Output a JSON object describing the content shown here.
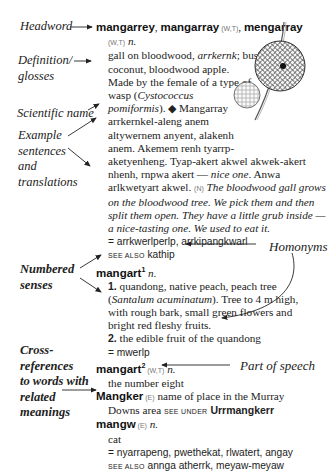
{
  "annotations": {
    "headword": "Headword",
    "definition": [
      "Definition/",
      "glosses"
    ],
    "scientific": "Scientific name",
    "examples": [
      "Example",
      "sentences",
      "and",
      "translations"
    ],
    "homonyms": "Homonyms",
    "numbered": [
      "Numbered",
      "senses"
    ],
    "crossref": [
      "Cross-",
      "references",
      "to words with",
      "related",
      "meanings"
    ],
    "pos": "Part of speech"
  },
  "entries": {
    "mangarrey": {
      "hw1": "mangarrey",
      "sep1": ", ",
      "hw2": "mangarray",
      "dial2": " (W,T)",
      "sep2": ", ",
      "hw3": "mengarray",
      "dial3": "(W,T)",
      "pos": " n.",
      "def_lines": [
        "gall on bloodwood, ",
        "coconut, bloodwood apple.",
        "Made by the female of a type of",
        "wasp (",
        "pomiformis"
      ],
      "def_italic": "arrkernk",
      "def_tail": "; bush",
      "sci_name_1": "Cystococcus",
      "sci_tail": "). ◆ Mangarray",
      "example_lines": [
        "arrkernkel-aleng anem",
        "altywernem anyent, alakenh",
        "anem. Akemem renh tyarrp-",
        "aketyenheng. Tyap-akert akwel akwek-akert",
        "nhenh, rnpwa akert — "
      ],
      "example_italic": "nice one",
      "example_tail": ". Anwa",
      "example_last": "arlkwetyart akwel. ",
      "trans_dial": "(N)",
      "translation_lines": [
        " The bloodwood gall grows",
        "on the bloodwood tree. We pick them and then",
        "split them open. They have a little grub inside —",
        "a nice-tasting one. We used to eat it."
      ],
      "synonyms": "= arrkwerlperlp, arrkipangkwarl",
      "see_also_label": "see also",
      "see_also": " kathip"
    },
    "mangart1": {
      "hw": "mangart",
      "sup": "1",
      "pos": " n.",
      "sense1_num": "1.",
      "sense1_lines": [
        " quandong, native peach, peach tree",
        "(",
        "). Tree to 4 m high,",
        "with rough bark, small green flowers and",
        "bright red fleshy fruits."
      ],
      "sense1_sci": "Santalum acuminatum",
      "sense2_num": "2.",
      "sense2": " the edible fruit of the quandong",
      "synonyms": "= mwerlp"
    },
    "mangart2": {
      "hw": "mangart",
      "sup": "2",
      "dial": " (W,T)",
      "pos": " n.",
      "def": "the number eight"
    },
    "mangker": {
      "hw": "Mangker",
      "dial": " (E)",
      "def1": " name of place in the Murray",
      "def2": "Downs area ",
      "see_under_label": "see under",
      "see_under": " Urrmangkerr"
    },
    "mangw": {
      "hw": "mangw",
      "dial": " (E)",
      "pos": " n.",
      "def": "cat",
      "synonyms": "= nyarrapeng, pwethekat, rlwatert, angay",
      "see_also_label": "see also",
      "see_also": " annga atherrk, meyaw-meyaw"
    }
  },
  "illustration": {
    "name": "bloodwood gall drawing"
  }
}
